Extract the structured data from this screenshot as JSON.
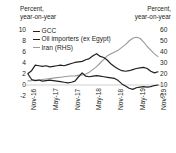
{
  "chart_data": {
    "type": "line",
    "title": "",
    "left_axis": {
      "label_line1": "Percent,",
      "label_line2": "year-on-year",
      "ticks": [
        "10",
        "8",
        "6",
        "4",
        "2",
        "0",
        "-2"
      ],
      "ylim": [
        -2,
        10
      ]
    },
    "right_axis": {
      "label_line1": "Percent,",
      "label_line2": "year-on-year",
      "ticks": [
        "60",
        "50",
        "40",
        "30",
        "20",
        "10",
        "0"
      ],
      "ylim": [
        0,
        60
      ]
    },
    "xlabel": "",
    "categories": [
      "Nov-16",
      "May-17",
      "Nov-17",
      "May-18",
      "Nov-18",
      "May-19",
      "Nov-19"
    ],
    "xlim": [
      "Nov-16",
      "Nov-19"
    ],
    "grid": false,
    "legend_position": "top-left",
    "series": [
      {
        "name": "GCC",
        "axis": "left",
        "color": "#231f20",
        "x": [
          "Nov-16",
          "Dec-16",
          "Jan-17",
          "Feb-17",
          "Mar-17",
          "Apr-17",
          "May-17",
          "Jun-17",
          "Jul-17",
          "Aug-17",
          "Sep-17",
          "Oct-17",
          "Nov-17",
          "Dec-17",
          "Jan-18",
          "Feb-18",
          "Mar-18",
          "Apr-18",
          "May-18",
          "Jun-18",
          "Jul-18",
          "Aug-18",
          "Sep-18",
          "Oct-18",
          "Nov-18",
          "Dec-18",
          "Jan-19",
          "Feb-19",
          "Mar-19",
          "Apr-19",
          "May-19",
          "Jun-19",
          "Jul-19",
          "Aug-19",
          "Sep-19",
          "Oct-19",
          "Nov-19"
        ],
        "values": [
          2.0,
          1.0,
          0.8,
          0.9,
          0.7,
          0.8,
          0.9,
          0.8,
          0.7,
          0.6,
          0.5,
          0.4,
          0.5,
          0.7,
          1.5,
          2.2,
          1.6,
          1.5,
          1.6,
          1.7,
          1.6,
          1.5,
          1.4,
          1.3,
          1.2,
          0.8,
          0.2,
          -0.2,
          -0.6,
          -0.8,
          -0.5,
          -0.4,
          -0.3,
          -0.4,
          -0.3,
          -0.1,
          0.0
        ]
      },
      {
        "name": "Oil importers (ex Egypt)",
        "axis": "left",
        "color": "#231f20",
        "x": [
          "Nov-16",
          "Dec-16",
          "Jan-17",
          "Feb-17",
          "Mar-17",
          "Apr-17",
          "May-17",
          "Jun-17",
          "Jul-17",
          "Aug-17",
          "Sep-17",
          "Oct-17",
          "Nov-17",
          "Dec-17",
          "Jan-18",
          "Feb-18",
          "Mar-18",
          "Apr-18",
          "May-18",
          "Jun-18",
          "Jul-18",
          "Aug-18",
          "Sep-18",
          "Oct-18",
          "Nov-18",
          "Dec-18",
          "Jan-19",
          "Feb-19",
          "Mar-19",
          "Apr-19",
          "May-19",
          "Jun-19",
          "Jul-19",
          "Aug-19",
          "Sep-19",
          "Oct-19",
          "Nov-19"
        ],
        "values": [
          2.1,
          2.6,
          3.6,
          3.5,
          3.4,
          3.5,
          3.3,
          3.4,
          3.5,
          3.6,
          3.5,
          3.7,
          3.9,
          4.1,
          4.2,
          4.3,
          4.6,
          4.8,
          5.3,
          5.7,
          5.2,
          5.0,
          4.5,
          3.8,
          3.3,
          2.9,
          2.6,
          2.5,
          2.6,
          2.8,
          3.0,
          3.1,
          3.2,
          3.0,
          2.5,
          2.2,
          2.4
        ]
      },
      {
        "name": "Iran (RHS)",
        "axis": "right",
        "color": "#9a9a9a",
        "x": [
          "Nov-16",
          "Dec-16",
          "Jan-17",
          "Feb-17",
          "Mar-17",
          "Apr-17",
          "May-17",
          "Jun-17",
          "Jul-17",
          "Aug-17",
          "Sep-17",
          "Oct-17",
          "Nov-17",
          "Dec-17",
          "Jan-18",
          "Feb-18",
          "Mar-18",
          "Apr-18",
          "May-18",
          "Jun-18",
          "Jul-18",
          "Aug-18",
          "Sep-18",
          "Oct-18",
          "Nov-18",
          "Dec-18",
          "Jan-19",
          "Feb-19",
          "Mar-19",
          "Apr-19",
          "May-19",
          "Jun-19",
          "Jul-19",
          "Aug-19",
          "Sep-19",
          "Oct-19",
          "Nov-19"
        ],
        "values": [
          4.5,
          4.8,
          5.2,
          5.5,
          6.0,
          6.5,
          7.0,
          7.5,
          8.0,
          8.5,
          9.0,
          9.5,
          9.8,
          10.0,
          10.5,
          11.0,
          12.0,
          14.0,
          17.0,
          20.0,
          24.0,
          28.0,
          32.0,
          34.0,
          36.0,
          38.0,
          41.0,
          44.0,
          48.0,
          51.0,
          52.0,
          51.0,
          47.0,
          42.0,
          38.0,
          34.0,
          31.0
        ]
      }
    ]
  }
}
